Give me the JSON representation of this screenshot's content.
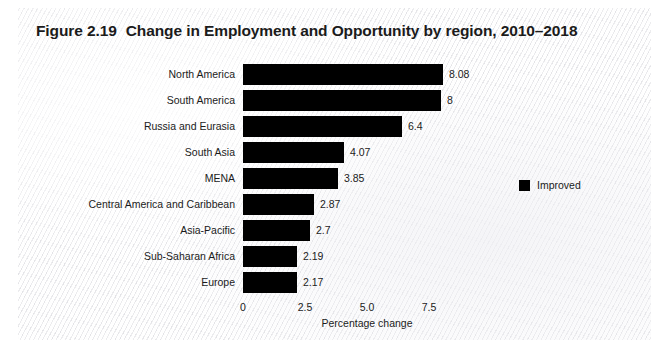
{
  "figure": {
    "number": "Figure 2.19",
    "title": "Change in Employment and Opportunity by region, 2010–2018"
  },
  "legend": {
    "position": "right",
    "items": [
      {
        "label": "Improved",
        "color": "#000000",
        "swatch_icon": "square-swatch-icon"
      }
    ]
  },
  "axis": {
    "x_title": "Percentage change",
    "x_ticks": [
      "0",
      "2.5",
      "5.0",
      "7.5"
    ],
    "x_tick_values": [
      0,
      2.5,
      5.0,
      7.5
    ]
  },
  "chart_data": {
    "type": "bar",
    "orientation": "horizontal",
    "xlabel": "Percentage change",
    "ylabel": "",
    "xlim": [
      0,
      9.2
    ],
    "grid": false,
    "legend": [
      "Improved"
    ],
    "legend_position": "right",
    "categories": [
      "North America",
      "South America",
      "Russia and Eurasia",
      "South Asia",
      "MENA",
      "Central America and Caribbean",
      "Asia-Pacific",
      "Sub-Saharan Africa",
      "Europe"
    ],
    "series": [
      {
        "name": "Improved",
        "color": "#000000",
        "values": [
          8.08,
          8,
          6.4,
          4.07,
          3.85,
          2.87,
          2.7,
          2.19,
          2.17
        ],
        "labels": [
          "8.08",
          "8",
          "6.4",
          "4.07",
          "3.85",
          "2.87",
          "2.7",
          "2.19",
          "2.17"
        ]
      }
    ]
  },
  "colors": {
    "bar": "#000000",
    "text": "#1b1b1b",
    "page": "#f4f4f5"
  }
}
